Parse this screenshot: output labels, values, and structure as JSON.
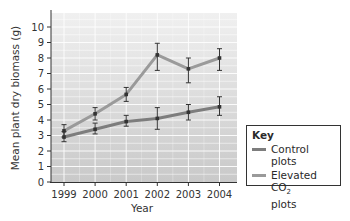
{
  "chart_data": {
    "type": "line",
    "title": "",
    "xlabel": "Year",
    "ylabel": "Mean plant dry biomass (g)",
    "categories": [
      "1999",
      "2000",
      "2001",
      "2002",
      "2003",
      "2004"
    ],
    "ylim": [
      0,
      10
    ],
    "yticks": [
      0,
      1,
      2,
      3,
      4,
      5,
      6,
      7,
      8,
      9,
      10
    ],
    "grid": true,
    "legend_position": "right",
    "series": [
      {
        "name": "Control plots",
        "color": "#7d7d7d",
        "values": [
          2.9,
          3.4,
          3.9,
          4.1,
          4.5,
          4.85
        ],
        "error_low": [
          2.6,
          3.1,
          3.6,
          3.4,
          4.0,
          4.3
        ],
        "error_high": [
          3.25,
          3.8,
          4.3,
          4.8,
          5.0,
          5.5
        ]
      },
      {
        "name": "Elevated CO2 plots",
        "color": "#9a9a9a",
        "values": [
          3.3,
          4.4,
          5.65,
          8.2,
          7.3,
          8.0
        ],
        "error_low": [
          2.9,
          4.0,
          5.2,
          7.2,
          6.4,
          7.2
        ],
        "error_high": [
          3.7,
          4.8,
          6.1,
          8.95,
          8.0,
          8.6
        ]
      }
    ]
  },
  "legend": {
    "title": "Key",
    "items": [
      {
        "label": "Control plots",
        "color": "#7d7d7d"
      },
      {
        "label_main": "Elevated CO",
        "label_sub": "2",
        "label_line2": "plots",
        "color": "#9a9a9a"
      }
    ]
  },
  "axes": {
    "xlabel": "Year",
    "ylabel": "Mean plant dry biomass (g)"
  }
}
